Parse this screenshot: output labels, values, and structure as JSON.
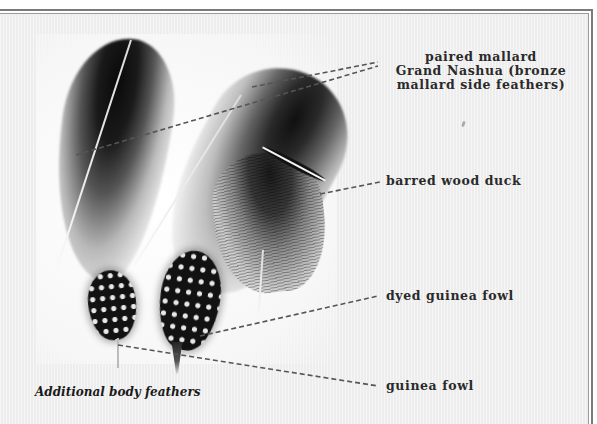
{
  "figure": {
    "caption": "Additional body feathers",
    "labels": {
      "mallard": {
        "line1": "paired mallard",
        "line2": "Grand Nashua (bronze",
        "line3": "mallard side feathers)"
      },
      "wood_duck": "barred wood duck",
      "dyed_guinea": "dyed guinea fowl",
      "guinea": "guinea fowl"
    },
    "colors": {
      "background": "#f1f1f1",
      "frame": "#7a7a7a",
      "label_text": "#2a2a2a",
      "leader_line": "#555555"
    }
  }
}
